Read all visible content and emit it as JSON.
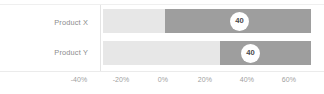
{
  "chart_data": {
    "type": "bar",
    "orientation": "horizontal",
    "subtype": "floating-range-bar",
    "title": "",
    "subtitle": "",
    "xlabel": "",
    "ylabel": "",
    "grid": false,
    "legend": null,
    "categories": [
      "Product X",
      "Product Y"
    ],
    "xlim": [
      -40,
      60
    ],
    "xticks": [
      -40,
      -20,
      0,
      20,
      40,
      60
    ],
    "xticklabels": [
      "-40%",
      "-20%",
      "0%",
      "20%",
      "40%",
      "60%"
    ],
    "series": [
      {
        "name": "base",
        "color": "#e7e7e7",
        "values": [
          {
            "start": -40,
            "end": 0
          },
          {
            "start": -40,
            "end": 27
          }
        ]
      },
      {
        "name": "highlight",
        "color": "#9e9e9e",
        "values": [
          {
            "start": 0,
            "end": 59
          },
          {
            "start": 27,
            "end": 59
          }
        ]
      }
    ],
    "data_labels": [
      {
        "category": "Product X",
        "value": "40",
        "position": 37
      },
      {
        "category": "Product Y",
        "value": "40",
        "position": 42
      }
    ],
    "colors": {
      "light_segment": "#e7e7e7",
      "dark_segment": "#9e9e9e",
      "bubble_fill": "#ffffff",
      "bubble_text": "#4a4a4a",
      "tick_text": "#a0a0a0",
      "category_text": "#8c8c8c",
      "axis_line": "#e4e4e4",
      "background": "#ffffff"
    }
  },
  "axis": {
    "ticks": [
      {
        "label": "-40%",
        "x": 79
      },
      {
        "label": "-20%",
        "x": 121
      },
      {
        "label": "0%",
        "x": 163
      },
      {
        "label": "20%",
        "x": 205
      },
      {
        "label": "40%",
        "x": 247
      },
      {
        "label": "60%",
        "x": 289
      }
    ]
  },
  "rows": [
    {
      "label": "Product X",
      "light": {
        "left": 103,
        "width": 62
      },
      "dark": {
        "left": 165,
        "width": 146
      },
      "bubble": {
        "left": 230,
        "value": "40"
      }
    },
    {
      "label": "Product Y",
      "light": {
        "left": 103,
        "width": 117
      },
      "dark": {
        "left": 220,
        "width": 91
      },
      "bubble": {
        "left": 241,
        "value": "40"
      }
    }
  ]
}
